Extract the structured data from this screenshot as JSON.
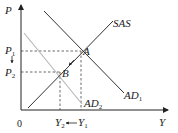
{
  "diagram": {
    "axes": {
      "y_label": "P",
      "x_label": "Y",
      "origin_label": "0"
    },
    "curves": [
      {
        "id": "sas",
        "label": "SAS",
        "sub": "",
        "color": "#333333",
        "type": "upward"
      },
      {
        "id": "ad1",
        "label": "AD",
        "sub": "1",
        "color": "#333333",
        "type": "downward"
      },
      {
        "id": "ad2",
        "label": "AD",
        "sub": "2",
        "color": "#b0b0b0",
        "type": "downward"
      }
    ],
    "points": [
      {
        "id": "A",
        "label": "A",
        "on": [
          "sas",
          "ad1"
        ]
      },
      {
        "id": "B",
        "label": "B",
        "on": [
          "sas",
          "ad2"
        ]
      }
    ],
    "price_levels": [
      {
        "label": "P",
        "sub": "1",
        "point": "A"
      },
      {
        "label": "P",
        "sub": "2",
        "point": "B"
      }
    ],
    "output_levels": [
      {
        "label": "Y",
        "sub": "2",
        "point": "B"
      },
      {
        "label": "Y",
        "sub": "1",
        "point": "A"
      }
    ],
    "annotations": {
      "price_shift": "P1 → P2 (down arrow)",
      "output_shift": "Y1 → Y2 (left arrow)",
      "movement": "A → B along SAS"
    }
  }
}
